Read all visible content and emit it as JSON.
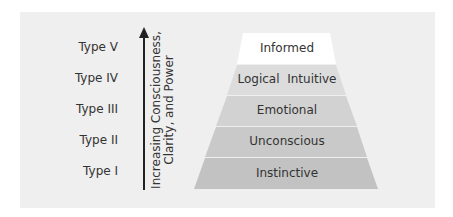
{
  "diagram": {
    "axis_label": "Increasing Consciousness, Clarity, and Power",
    "axis_label_lines": [
      "Increasing Consciousness,",
      "Clarity, and Power"
    ],
    "types": [
      {
        "label": "Type V",
        "tier": "Informed",
        "fill": "#ffffff"
      },
      {
        "label": "Type IV",
        "tier": "Logical  Intuitive",
        "fill": "#dcdcdc"
      },
      {
        "label": "Type III",
        "tier": "Emotional",
        "fill": "#d2d2d2"
      },
      {
        "label": "Type II",
        "tier": "Unconscious",
        "fill": "#c9c9c9"
      },
      {
        "label": "Type I",
        "tier": "Instinctive",
        "fill": "#c2c2c2"
      }
    ],
    "colors": {
      "panel_bg": "#efefef",
      "text": "#333333",
      "arrow": "#222222"
    }
  }
}
